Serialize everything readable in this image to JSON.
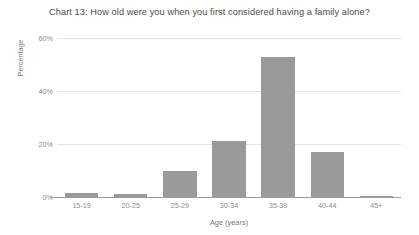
{
  "chart_data": {
    "type": "bar",
    "title": "Chart 13: How old were you when you first considered having a family alone?",
    "xlabel": "Age (years)",
    "ylabel": "Percentage",
    "categories": [
      "15-19",
      "20-25",
      "25-29",
      "30-34",
      "35-39",
      "40-44",
      "45+"
    ],
    "values": [
      1.5,
      1,
      10,
      21,
      53,
      17,
      0.3
    ],
    "ylim": [
      0,
      60
    ],
    "yticks": [
      0,
      20,
      40,
      60
    ],
    "ytick_labels": [
      "0%",
      "20%",
      "40%",
      "60%"
    ],
    "grid": true,
    "legend": "none",
    "series": [
      {
        "name": "Percentage",
        "values": [
          1.5,
          1,
          10,
          21,
          53,
          17,
          0.3
        ]
      }
    ],
    "colors": {
      "bar": "#9a9a9a",
      "gridline": "#e4e4e4",
      "axis": "#9c9c9c",
      "title_text": "#4b4b4b",
      "tick_text": "#8a8a8a",
      "background": "#ffffff"
    }
  }
}
